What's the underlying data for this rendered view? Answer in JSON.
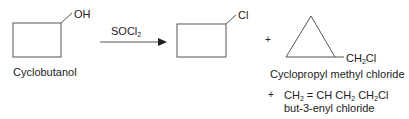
{
  "reaction": {
    "reactant": {
      "name": "Cyclobutanol",
      "substituent": "OH",
      "ring": "cyclobutane"
    },
    "reagent": {
      "main": "SOCl",
      "subscript": "2"
    },
    "products": [
      {
        "ring": "cyclobutane",
        "substituent": "Cl",
        "name": ""
      },
      {
        "ring": "cyclopropane",
        "substituent_main": "CH",
        "substituent_sub": "2",
        "substituent_tail": "Cl",
        "name": "Cyclopropyl methyl chloride"
      },
      {
        "formula_parts": [
          "CH",
          "2",
          " = CH CH",
          "2",
          " CH",
          "2",
          "Cl"
        ],
        "name": "but-3-enyl chloride"
      }
    ],
    "plus_sign": "+"
  }
}
